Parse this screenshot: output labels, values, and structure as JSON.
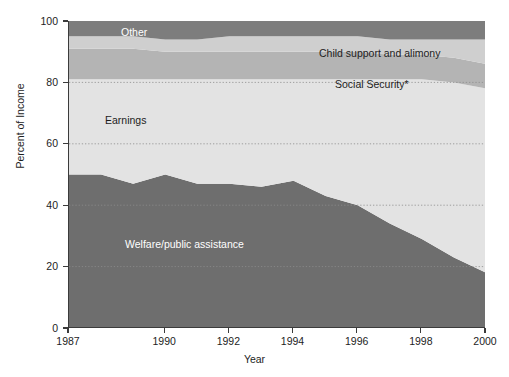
{
  "chart_data": {
    "type": "area",
    "stacked": true,
    "title": "",
    "xlabel": "Year",
    "ylabel": "Percent of Income",
    "xlim": [
      1987,
      2000
    ],
    "ylim": [
      0,
      100
    ],
    "grid": true,
    "grid_axis": "y",
    "legend_position": "inline-labels",
    "x_ticks": [
      "1987",
      "1990",
      "1992",
      "1994",
      "1996",
      "1998",
      "2000"
    ],
    "x_tick_values": [
      1987,
      1990,
      1992,
      1994,
      1996,
      1998,
      2000
    ],
    "y_ticks": [
      "0",
      "20",
      "40",
      "60",
      "80",
      "100"
    ],
    "y_tick_values": [
      0,
      20,
      40,
      60,
      80,
      100
    ],
    "x": [
      1987,
      1988,
      1989,
      1990,
      1991,
      1992,
      1993,
      1994,
      1995,
      1996,
      1997,
      1998,
      1999,
      2000
    ],
    "series": [
      {
        "name": "Welfare/public assistance",
        "color": "#6e6e6e",
        "label_color": "#ffffff",
        "values": [
          50,
          50,
          47,
          50,
          47,
          47,
          46,
          48,
          43,
          40,
          34,
          29,
          23,
          18
        ]
      },
      {
        "name": "Earnings",
        "color": "#e3e3e3",
        "label_color": "#1d1d1d",
        "values": [
          31,
          31,
          34,
          31,
          34,
          34,
          35,
          33,
          38,
          41,
          47,
          52,
          57,
          60
        ]
      },
      {
        "name": "Social Security*",
        "color": "#b4b4b4",
        "label_color": "#1d1d1d",
        "values": [
          10,
          10,
          10,
          9,
          9,
          9,
          9,
          9,
          9,
          9,
          8,
          8,
          8,
          8
        ]
      },
      {
        "name": "Child support and alimony",
        "color": "#cfcfcf",
        "label_color": "#1d1d1d",
        "values": [
          4,
          4,
          4,
          4,
          4,
          5,
          5,
          5,
          5,
          5,
          5,
          5,
          6,
          8
        ]
      },
      {
        "name": "Other",
        "color": "#7d7d7d",
        "label_color": "#ffffff",
        "values": [
          5,
          5,
          5,
          6,
          6,
          5,
          5,
          5,
          5,
          5,
          6,
          6,
          6,
          6
        ]
      }
    ]
  },
  "axes": {
    "y_title": "Percent of Income",
    "x_title": "Year",
    "y_tick_labels": [
      "100",
      "80",
      "60",
      "40",
      "20",
      "0"
    ],
    "x_tick_labels": [
      "1987",
      "1990",
      "1992",
      "1994",
      "1996",
      "1998",
      "2000"
    ]
  },
  "series_labels": {
    "other": "Other",
    "child_support": "Child support and alimony",
    "social_security": "Social Security*",
    "earnings": "Earnings",
    "welfare": "Welfare/public assistance"
  },
  "colors": {
    "other": "#7d7d7d",
    "child_support": "#cfcfcf",
    "social_security": "#b4b4b4",
    "earnings": "#e3e3e3",
    "welfare": "#6e6e6e",
    "axis": "#3b3b3b",
    "grid": "#8d8d8d",
    "text": "#1d1d1d",
    "background": "#ffffff"
  }
}
